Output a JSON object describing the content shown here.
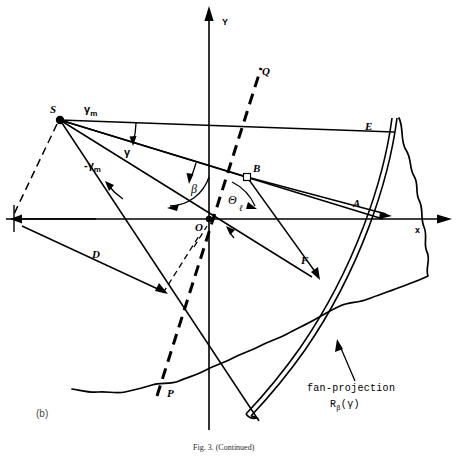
{
  "figure": {
    "panel_label": "(b)",
    "caption": "Fig. 3. (Continued)",
    "axes": {
      "y_label": "Y",
      "x_label": "x"
    },
    "points": {
      "source": "S",
      "origin": "O",
      "detector_edge": "E",
      "axis_intercept": "A",
      "foot_of_perpendicular": "B",
      "ray_end_lower": "P",
      "ray_end_upper": "Q"
    },
    "angles": {
      "gamma": "γ",
      "gamma_max": "γ",
      "gamma_max_sub": "m",
      "gamma_min": "-γ",
      "gamma_min_sub": "m",
      "beta": "β",
      "theta": "Θ"
    },
    "distances": {
      "source_to_origin": "D",
      "ray_label": "F",
      "perp_distance": "ℓ"
    },
    "annotation": {
      "name": "fan-projection",
      "symbol": "R",
      "symbol_sub": "β",
      "symbol_arg": "(γ)"
    },
    "colors": {
      "ink": "#000000",
      "background": "#ffffff",
      "muted": "#4a4a4a"
    }
  }
}
